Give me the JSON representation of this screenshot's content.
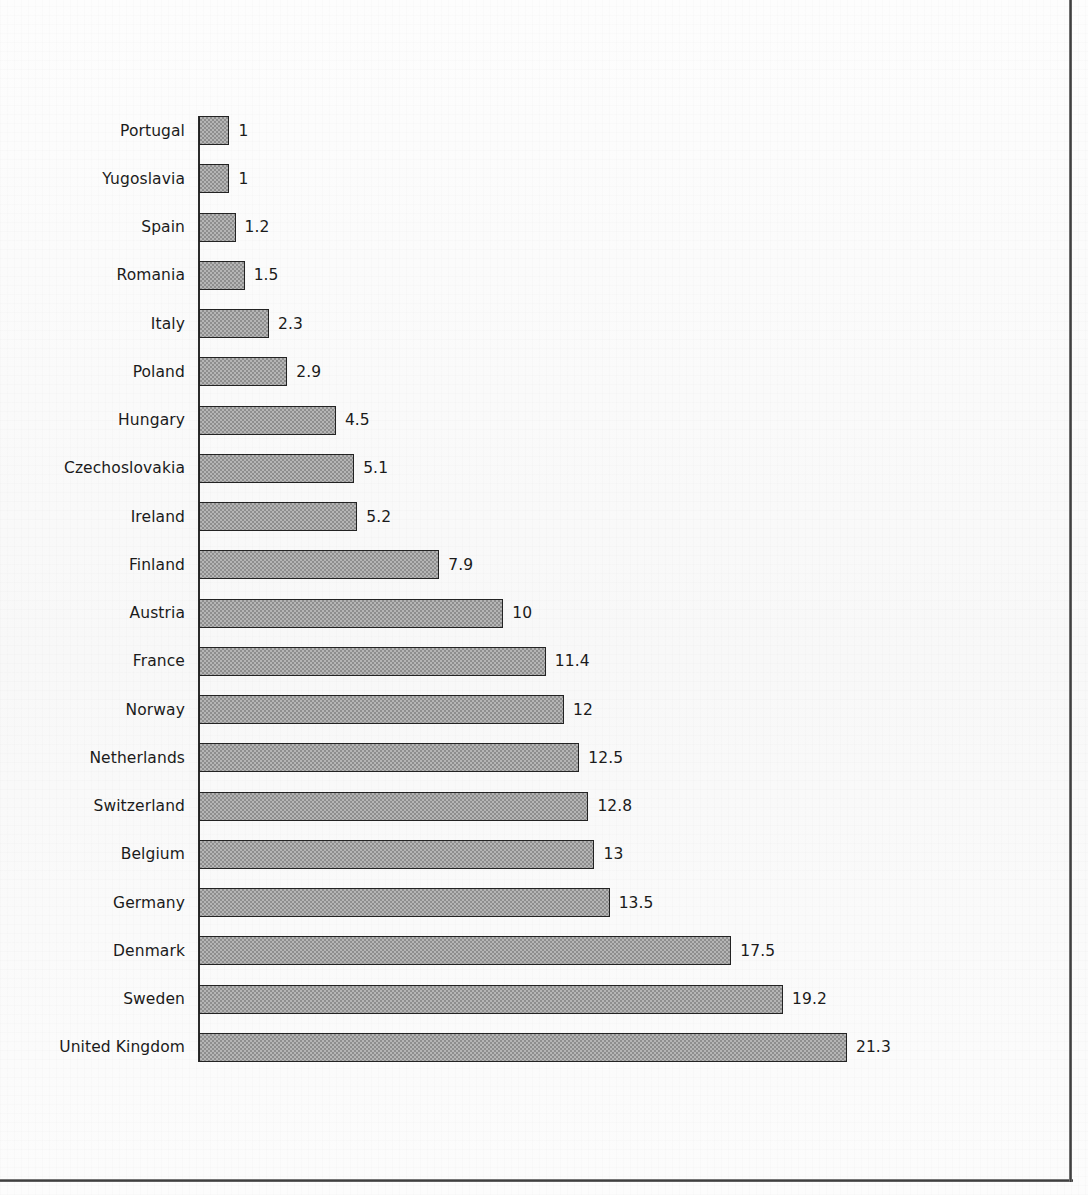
{
  "page": {
    "background_color": "#fbfbfb",
    "frame_rule_color": "#3b3b3b"
  },
  "chart_data": {
    "type": "bar",
    "orientation": "horizontal",
    "title": "",
    "subtitle": "",
    "xlabel": "",
    "ylabel": "",
    "xlim": [
      0,
      21.3
    ],
    "grid": false,
    "legend": null,
    "value_labels_shown": true,
    "bar_fill_color": "#a0a0a0",
    "bar_border_color": "#232323",
    "axis_color": "#2b2b2b",
    "categories": [
      "Portugal",
      "Yugoslavia",
      "Spain",
      "Romania",
      "Italy",
      "Poland",
      "Hungary",
      "Czechoslovakia",
      "Ireland",
      "Finland",
      "Austria",
      "France",
      "Norway",
      "Netherlands",
      "Switzerland",
      "Belgium",
      "Germany",
      "Denmark",
      "Sweden",
      "United Kingdom"
    ],
    "values": [
      1,
      1,
      1.2,
      1.5,
      2.3,
      2.9,
      4.5,
      5.1,
      5.2,
      7.9,
      10,
      11.4,
      12,
      12.5,
      12.8,
      13,
      13.5,
      17.5,
      19.2,
      21.3
    ],
    "value_labels": [
      "1",
      "1",
      "1.2",
      "1.5",
      "2.3",
      "2.9",
      "4.5",
      "5.1",
      "5.2",
      "7.9",
      "10",
      "11.4",
      "12",
      "12.5",
      "12.8",
      "13",
      "13.5",
      "17.5",
      "19.2",
      "21.3"
    ]
  }
}
